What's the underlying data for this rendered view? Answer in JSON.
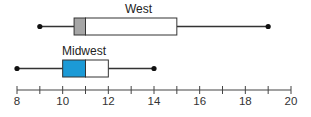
{
  "chart_data": {
    "type": "boxplot",
    "title": "",
    "xlabel": "",
    "ylabel": "",
    "xlim": [
      8,
      20
    ],
    "x_ticks": [
      8,
      9,
      10,
      11,
      12,
      13,
      14,
      15,
      16,
      17,
      18,
      19,
      20
    ],
    "x_tick_labels": [
      "8",
      "10",
      "12",
      "14",
      "16",
      "18",
      "20"
    ],
    "grid": false,
    "legend": "none",
    "series": [
      {
        "name": "West",
        "min": 9,
        "q1": 10.5,
        "median": 11,
        "q3": 15,
        "max": 19,
        "fill_lower": "#a6a6a6",
        "fill_upper": "#ffffff"
      },
      {
        "name": "Midwest",
        "min": 8,
        "q1": 10,
        "median": 11,
        "q3": 12,
        "max": 14,
        "fill_lower": "#1c9ad6",
        "fill_upper": "#ffffff"
      }
    ]
  },
  "layout": {
    "axis_x0_px": 17,
    "axis_x1_px": 291,
    "axis_y_px": 90,
    "rows": [
      {
        "box_top": 18,
        "box_bottom": 35,
        "label_x": 125,
        "label_y": 13
      },
      {
        "box_top": 60,
        "box_bottom": 77,
        "label_x": 62,
        "label_y": 55
      }
    ]
  }
}
